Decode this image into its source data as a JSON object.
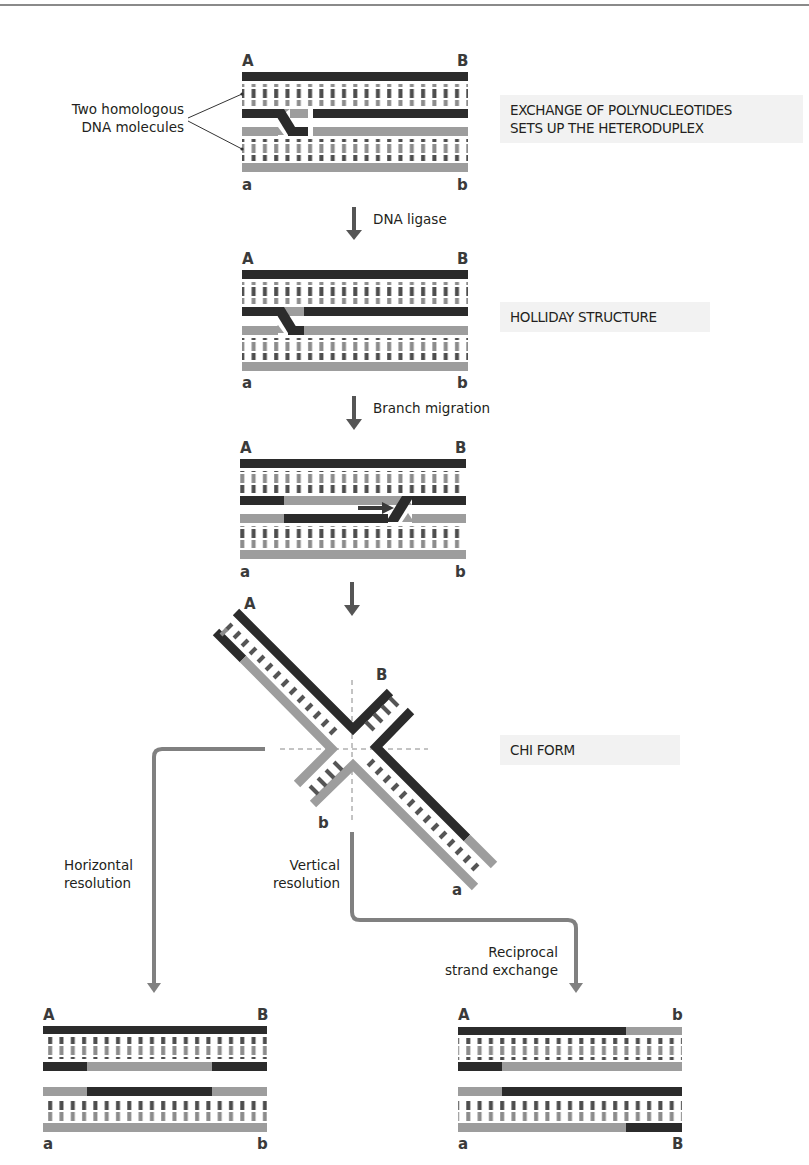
{
  "colors": {
    "dark_strand": "#2b2b2b",
    "light_strand": "#9d9d9d",
    "rung_dark": "#4a4a4a",
    "rung_light": "#8f8f8f",
    "path_arrow": "#808080",
    "step_arrow": "#555555",
    "label_bg": "#f2f2f2"
  },
  "figure": {
    "callout": {
      "line1": "Two homologous",
      "line2": "DNA molecules"
    },
    "stages": [
      {
        "id": "heteroduplex",
        "line1": "EXCHANGE OF POLYNUCLEOTIDES",
        "line2": "SETS UP THE HETERODUPLEX"
      },
      {
        "id": "holliday",
        "line1": "HOLLIDAY STRUCTURE"
      },
      {
        "id": "branch",
        "line1": ""
      },
      {
        "id": "chi",
        "line1": "CHI FORM"
      }
    ],
    "steps": [
      {
        "label": "DNA ligase"
      },
      {
        "label": "Branch migration"
      },
      {
        "label": ""
      }
    ],
    "duplex_ends": {
      "stage1": {
        "top_left": "A",
        "top_right": "B",
        "bottom_left": "a",
        "bottom_right": "b"
      },
      "stage2": {
        "top_left": "A",
        "top_right": "B",
        "bottom_left": "a",
        "bottom_right": "b"
      },
      "stage3": {
        "top_left": "A",
        "top_right": "B",
        "bottom_left": "a",
        "bottom_right": "b"
      },
      "chi": {
        "upper_left": "A",
        "upper_right": "B",
        "lower_left": "b",
        "lower_right": "a"
      },
      "horizontal_product": {
        "top_left": "A",
        "top_right": "B",
        "bottom_left": "a",
        "bottom_right": "b"
      },
      "vertical_product": {
        "top_left": "A",
        "top_right": "b",
        "bottom_left": "a",
        "bottom_right": "B"
      }
    },
    "resolution": {
      "horizontal": {
        "line1": "Horizontal",
        "line2": "resolution"
      },
      "vertical": {
        "line1": "Vertical",
        "line2": "resolution"
      },
      "reciprocal": {
        "line1": "Reciprocal",
        "line2": "strand exchange"
      }
    }
  }
}
